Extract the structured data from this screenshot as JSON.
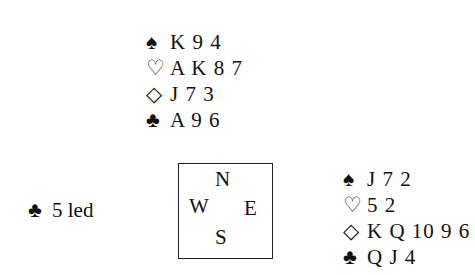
{
  "north": {
    "spades": {
      "symbol": "♠",
      "cards": "K 9 4"
    },
    "hearts": {
      "symbol": "♡",
      "cards": "A K 8 7"
    },
    "diamonds": {
      "symbol": "◇",
      "cards": "J 7 3"
    },
    "clubs": {
      "symbol": "♣",
      "cards": "A 9 6"
    }
  },
  "east": {
    "spades": {
      "symbol": "♠",
      "cards": "J 7 2"
    },
    "hearts": {
      "symbol": "♡",
      "cards": "5 2"
    },
    "diamonds": {
      "symbol": "◇",
      "cards": "K Q 10 9 6"
    },
    "clubs": {
      "symbol": "♣",
      "cards": "Q J 4"
    }
  },
  "lead": {
    "symbol": "♣",
    "text": "5 led"
  },
  "compass": {
    "n": "N",
    "w": "W",
    "e": "E",
    "s": "S"
  }
}
